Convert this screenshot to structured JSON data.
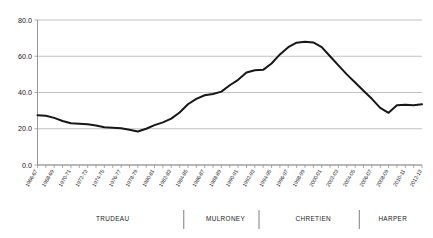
{
  "chart_data": {
    "type": "line",
    "title": "",
    "subtitle": "",
    "xlabel": "",
    "ylabel": "",
    "ylim": [
      0.0,
      80.0
    ],
    "ytick_labels": [
      "0.0",
      "20.0",
      "40.0",
      "60.0",
      "80.0"
    ],
    "ytick_values": [
      0.0,
      20.0,
      40.0,
      60.0,
      80.0
    ],
    "grid": true,
    "legend": "none",
    "categories": [
      "1966-67",
      "1967-68",
      "1968-69",
      "1969-70",
      "1970-71",
      "1971-72",
      "1972-73",
      "1973-74",
      "1974-75",
      "1975-76",
      "1976-77",
      "1977-78",
      "1978-79",
      "1979-80",
      "1980-81",
      "1981-82",
      "1982-83",
      "1983-84",
      "1984-85",
      "1985-86",
      "1986-87",
      "1987-88",
      "1988-89",
      "1989-90",
      "1990-91",
      "1991-92",
      "1992-93",
      "1993-94",
      "1994-95",
      "1995-96",
      "1996-97",
      "1997-98",
      "1998-99",
      "1999-00",
      "2000-01",
      "2001-02",
      "2002-03",
      "2003-04",
      "2004-05",
      "2005-06",
      "2006-07",
      "2007-08",
      "2008-09",
      "2009-10",
      "2010-11",
      "2011-12",
      "2012-13"
    ],
    "visible_tick_labels": [
      "1966-67",
      "1968-69",
      "1970-71",
      "1972-73",
      "1974-75",
      "1976-77",
      "1978-79",
      "1980-81",
      "1982-83",
      "1984-85",
      "1986-87",
      "1988-89",
      "1990-91",
      "1992-93",
      "1994-95",
      "1996-97",
      "1998-99",
      "2000-01",
      "2002-03",
      "2004-05",
      "2006-07",
      "2008-09",
      "2010-11",
      "2012-13"
    ],
    "values": [
      27.5,
      27.2,
      26.0,
      24.3,
      23.0,
      22.8,
      22.5,
      21.8,
      20.8,
      20.6,
      20.3,
      19.4,
      18.5,
      20.0,
      22.0,
      23.5,
      25.6,
      29.0,
      33.5,
      36.5,
      38.5,
      39.2,
      40.5,
      44.0,
      47.0,
      51.0,
      52.3,
      52.5,
      56.0,
      61.0,
      65.0,
      67.5,
      68.0,
      67.6,
      65.0,
      60.0,
      55.0,
      50.0,
      45.5,
      41.0,
      36.5,
      31.5,
      28.8,
      33.0,
      33.2,
      33.0,
      33.5
    ],
    "eras": [
      {
        "label": "TRUDEAU",
        "start_index": 0,
        "end_index": 18
      },
      {
        "label": "MULRONEY",
        "start_index": 18,
        "end_index": 27
      },
      {
        "label": "CHRETIEN",
        "start_index": 27,
        "end_index": 39
      },
      {
        "label": "HARPER",
        "start_index": 39,
        "end_index": 46
      }
    ],
    "colors": {
      "line": "#171717",
      "grid": "#a8a8a8",
      "axis": "#7d7d7d",
      "text": "#1a1a1a",
      "background": "#ffffff"
    }
  }
}
